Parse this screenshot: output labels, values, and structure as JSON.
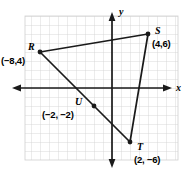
{
  "figure": {
    "type": "coordinate-plane-triangle",
    "background_color": "#ffffff",
    "grid_color": "#cfcfcf",
    "axis_color": "#1a1a1a",
    "shape_color": "#1a1a1a"
  },
  "axes": {
    "x_label": "x",
    "y_label": "y",
    "origin_px": {
      "x": 112,
      "y": 88
    },
    "cell_px": 9,
    "x_range": [
      -9.5,
      7.3
    ],
    "y_range": [
      -8,
      8.1
    ],
    "x_axis_arrows": [
      "left",
      "right"
    ],
    "y_axis_arrows": [
      "up",
      "down"
    ],
    "tick_labels_shown": false,
    "grid": true
  },
  "points": [
    {
      "name": "R",
      "coords_label": "(−8,4)",
      "x": -8,
      "y": 4,
      "label_pos": "left-above",
      "dot": true
    },
    {
      "name": "S",
      "coords_label": "(4,6)",
      "x": 4,
      "y": 6,
      "label_pos": "right",
      "dot": true
    },
    {
      "name": "T",
      "coords_label": "(2, −6)",
      "x": 2,
      "y": -6,
      "label_pos": "right-below",
      "dot": true
    },
    {
      "name": "U",
      "coords_label": "(−2, −2)",
      "x": -2,
      "y": -2,
      "label_pos": "left-above",
      "dot": true
    }
  ],
  "segments": [
    {
      "from": "R",
      "to": "S"
    },
    {
      "from": "S",
      "to": "T"
    },
    {
      "from": "R",
      "to": "T",
      "passes_through": "U"
    }
  ]
}
